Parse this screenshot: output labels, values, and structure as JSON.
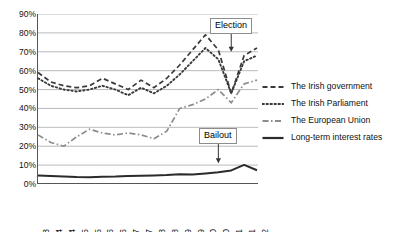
{
  "chart_data": {
    "type": "line",
    "title": "",
    "xlabel": "",
    "ylabel": "",
    "ylim": [
      0,
      90
    ],
    "ytick_labels": [
      "90%",
      "80%",
      "70%",
      "60%",
      "50%",
      "40%",
      "30%",
      "20%",
      "10%",
      "0%"
    ],
    "yticks": [
      90,
      80,
      70,
      60,
      50,
      40,
      30,
      20,
      10,
      0
    ],
    "grid": true,
    "legend_position": "right",
    "categories": [
      "Nov-03",
      "May-04",
      "Nov-04",
      "May-05",
      "Nov-05",
      "May-06",
      "Nov-06",
      "May-07",
      "Nov-07",
      "May-08",
      "Nov-08",
      "May-09",
      "Nov-09",
      "May-10",
      "Nov-10",
      "May-11",
      "Nov-11",
      "May-12"
    ],
    "series": [
      {
        "name": "The Irish government",
        "style": "dashed",
        "color": "#3a3a3a",
        "values": [
          59,
          54,
          52,
          51,
          52,
          56,
          53,
          50,
          55,
          51,
          56,
          63,
          71,
          79,
          71,
          48,
          68,
          72
        ]
      },
      {
        "name": "The Irish Parliament",
        "style": "dotted",
        "color": "#3a3a3a",
        "values": [
          56,
          52,
          50,
          49,
          50,
          52,
          50,
          47,
          51,
          48,
          52,
          58,
          65,
          72,
          66,
          48,
          65,
          68
        ]
      },
      {
        "name": "The European Union",
        "style": "dashdot",
        "color": "#8c8c8c",
        "values": [
          26,
          22,
          20,
          25,
          29,
          27,
          26,
          27,
          26,
          24,
          28,
          40,
          42,
          45,
          50,
          43,
          53,
          55
        ]
      },
      {
        "name": "Long-term interest rates",
        "style": "solid",
        "color": "#2b2b2b",
        "values": [
          4.5,
          4.3,
          4.0,
          3.7,
          3.6,
          3.9,
          4.0,
          4.3,
          4.4,
          4.5,
          4.7,
          5.2,
          5.0,
          5.6,
          6.2,
          7.2,
          10.1,
          7.3
        ]
      }
    ],
    "annotations": [
      {
        "label": "Election",
        "x_category": "May-11",
        "y_value": 84,
        "arrow": "down",
        "arrow_to": 70
      },
      {
        "label": "Bailout",
        "x_category": "Nov-10",
        "y_value": 26,
        "arrow": "down",
        "arrow_to": 11
      }
    ]
  }
}
